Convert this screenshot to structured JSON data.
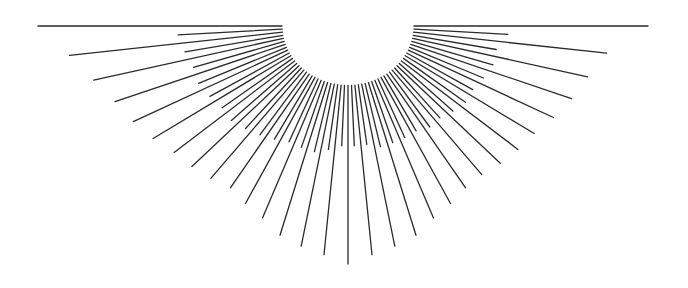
{
  "graphic": {
    "type": "sunburst-half-rays",
    "center": [
      348,
      26
    ],
    "inner_radius": 66,
    "stroke_color": "#2a2a2a",
    "background": "#ffffff",
    "rays": [
      {
        "angle": 0,
        "outer": 300
      },
      {
        "angle": 3,
        "outer": 160
      },
      {
        "angle": 6,
        "outer": 260
      },
      {
        "angle": 9,
        "outer": 150
      },
      {
        "angle": 12,
        "outer": 245
      },
      {
        "angle": 15,
        "outer": 150
      },
      {
        "angle": 18,
        "outer": 235
      },
      {
        "angle": 21,
        "outer": 145
      },
      {
        "angle": 24,
        "outer": 225
      },
      {
        "angle": 27,
        "outer": 140
      },
      {
        "angle": 30,
        "outer": 215
      },
      {
        "angle": 33,
        "outer": 140
      },
      {
        "angle": 36,
        "outer": 210
      },
      {
        "angle": 39,
        "outer": 135
      },
      {
        "angle": 42,
        "outer": 205
      },
      {
        "angle": 45,
        "outer": 130
      },
      {
        "angle": 48,
        "outer": 200
      },
      {
        "angle": 51,
        "outer": 130
      },
      {
        "angle": 54,
        "outer": 200
      },
      {
        "angle": 57,
        "outer": 125
      },
      {
        "angle": 60,
        "outer": 205
      },
      {
        "angle": 63,
        "outer": 125
      },
      {
        "angle": 66,
        "outer": 210
      },
      {
        "angle": 69,
        "outer": 125
      },
      {
        "angle": 72,
        "outer": 220
      },
      {
        "angle": 75,
        "outer": 125
      },
      {
        "angle": 78,
        "outer": 225
      },
      {
        "angle": 81,
        "outer": 120
      },
      {
        "angle": 84,
        "outer": 230
      },
      {
        "angle": 87,
        "outer": 120
      },
      {
        "angle": 90,
        "outer": 238
      },
      {
        "angle": 93,
        "outer": 120
      },
      {
        "angle": 96,
        "outer": 230
      },
      {
        "angle": 99,
        "outer": 125
      },
      {
        "angle": 102,
        "outer": 225
      },
      {
        "angle": 105,
        "outer": 130
      },
      {
        "angle": 108,
        "outer": 220
      },
      {
        "angle": 111,
        "outer": 130
      },
      {
        "angle": 114,
        "outer": 210
      },
      {
        "angle": 117,
        "outer": 130
      },
      {
        "angle": 120,
        "outer": 205
      },
      {
        "angle": 123,
        "outer": 135
      },
      {
        "angle": 126,
        "outer": 200
      },
      {
        "angle": 129,
        "outer": 140
      },
      {
        "angle": 132,
        "outer": 205
      },
      {
        "angle": 135,
        "outer": 145
      },
      {
        "angle": 138,
        "outer": 210
      },
      {
        "angle": 141,
        "outer": 150
      },
      {
        "angle": 144,
        "outer": 215
      },
      {
        "angle": 147,
        "outer": 150
      },
      {
        "angle": 150,
        "outer": 225
      },
      {
        "angle": 153,
        "outer": 155
      },
      {
        "angle": 156,
        "outer": 235
      },
      {
        "angle": 159,
        "outer": 160
      },
      {
        "angle": 162,
        "outer": 245
      },
      {
        "angle": 165,
        "outer": 160
      },
      {
        "angle": 168,
        "outer": 260
      },
      {
        "angle": 171,
        "outer": 165
      },
      {
        "angle": 174,
        "outer": 280
      },
      {
        "angle": 177,
        "outer": 170
      },
      {
        "angle": 180,
        "outer": 310
      }
    ]
  }
}
